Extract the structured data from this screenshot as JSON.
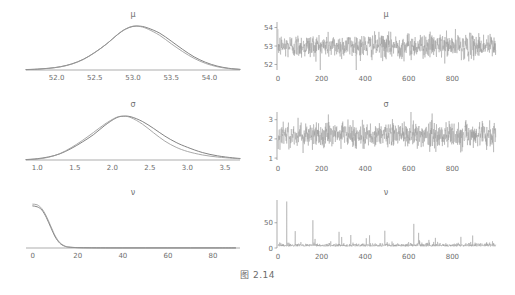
{
  "caption": "图 2.14",
  "figure": {
    "layout": "2 columns x 3 rows",
    "left_column": "posterior density",
    "right_column": "trace plot"
  },
  "panels": {
    "density_mu": {
      "title": "μ",
      "xticks": [
        "52.0",
        "52.5",
        "53.0",
        "53.5",
        "54.0"
      ]
    },
    "density_sigma": {
      "title": "σ",
      "xticks": [
        "1.0",
        "1.5",
        "2.0",
        "2.5",
        "3.0",
        "3.5"
      ]
    },
    "density_nu": {
      "title": "ν",
      "xticks": [
        "0",
        "20",
        "40",
        "60",
        "80"
      ]
    },
    "trace_mu": {
      "title": "μ",
      "yticks": [
        "52",
        "53",
        "54"
      ],
      "xticks": [
        "0",
        "200",
        "400",
        "600",
        "800"
      ]
    },
    "trace_sigma": {
      "title": "σ",
      "yticks": [
        "1",
        "2",
        "3"
      ],
      "xticks": [
        "0",
        "200",
        "400",
        "600",
        "800"
      ]
    },
    "trace_nu": {
      "title": "ν",
      "yticks": [
        "0",
        "50"
      ],
      "xticks": [
        "0",
        "200",
        "400",
        "600",
        "800"
      ]
    }
  },
  "chart_data": [
    {
      "type": "line",
      "name": "density_mu",
      "title": "μ",
      "xlabel": "",
      "ylabel": "",
      "xlim": [
        51.6,
        54.4
      ],
      "ylim": [
        0,
        1.05
      ],
      "grid": false,
      "legend": false,
      "series": [
        {
          "name": "kernel density",
          "color": "#6d6d6d",
          "x": [
            51.6,
            51.75,
            51.9,
            52.05,
            52.2,
            52.35,
            52.5,
            52.65,
            52.8,
            52.9,
            53.0,
            53.1,
            53.2,
            53.35,
            53.5,
            53.65,
            53.8,
            53.95,
            54.1,
            54.25,
            54.4
          ],
          "y": [
            0.01,
            0.02,
            0.04,
            0.075,
            0.14,
            0.245,
            0.4,
            0.59,
            0.81,
            0.93,
            0.995,
            1.0,
            0.955,
            0.84,
            0.66,
            0.47,
            0.3,
            0.175,
            0.09,
            0.04,
            0.015
          ]
        },
        {
          "name": "normal approximation",
          "color": "#9a9a9a",
          "x": [
            51.6,
            51.75,
            51.9,
            52.05,
            52.2,
            52.35,
            52.5,
            52.65,
            52.8,
            52.9,
            53.0,
            53.1,
            53.2,
            53.35,
            53.5,
            53.65,
            53.8,
            53.95,
            54.1,
            54.25,
            54.4
          ],
          "y": [
            0.008,
            0.018,
            0.038,
            0.072,
            0.135,
            0.24,
            0.398,
            0.588,
            0.815,
            0.935,
            1.0,
            0.99,
            0.93,
            0.79,
            0.6,
            0.42,
            0.265,
            0.15,
            0.075,
            0.033,
            0.012
          ]
        }
      ]
    },
    {
      "type": "line",
      "name": "density_sigma",
      "title": "σ",
      "xlabel": "",
      "ylabel": "",
      "xlim": [
        0.85,
        3.7
      ],
      "ylim": [
        0,
        1.05
      ],
      "grid": false,
      "legend": false,
      "series": [
        {
          "name": "kernel density",
          "color": "#6d6d6d",
          "x": [
            0.85,
            1.0,
            1.15,
            1.3,
            1.45,
            1.6,
            1.75,
            1.9,
            2.05,
            2.15,
            2.25,
            2.4,
            2.55,
            2.7,
            2.85,
            3.0,
            3.2,
            3.4,
            3.6,
            3.7
          ],
          "y": [
            0.01,
            0.03,
            0.07,
            0.14,
            0.26,
            0.41,
            0.58,
            0.79,
            0.96,
            1.0,
            0.985,
            0.88,
            0.72,
            0.545,
            0.4,
            0.29,
            0.17,
            0.095,
            0.05,
            0.035
          ]
        },
        {
          "name": "normal approximation",
          "color": "#9a9a9a",
          "x": [
            0.85,
            1.0,
            1.15,
            1.3,
            1.45,
            1.6,
            1.75,
            1.9,
            2.05,
            2.15,
            2.25,
            2.4,
            2.55,
            2.7,
            2.85,
            3.0,
            3.2,
            3.4,
            3.6,
            3.7
          ],
          "y": [
            0.006,
            0.022,
            0.062,
            0.145,
            0.28,
            0.445,
            0.63,
            0.82,
            0.97,
            1.0,
            0.965,
            0.82,
            0.62,
            0.43,
            0.29,
            0.195,
            0.115,
            0.068,
            0.04,
            0.03
          ]
        }
      ]
    },
    {
      "type": "line",
      "name": "density_nu",
      "title": "ν",
      "xlabel": "",
      "ylabel": "",
      "xlim": [
        -3,
        92
      ],
      "ylim": [
        0,
        1.05
      ],
      "grid": false,
      "legend": false,
      "series": [
        {
          "name": "kernel density",
          "color": "#6d6d6d",
          "x": [
            0,
            2,
            4,
            6,
            8,
            10,
            12,
            14,
            16,
            20,
            25,
            30,
            40,
            50,
            60,
            70,
            80,
            90
          ],
          "y": [
            0.96,
            0.94,
            0.87,
            0.7,
            0.47,
            0.25,
            0.11,
            0.045,
            0.02,
            0.008,
            0.004,
            0.003,
            0.002,
            0.002,
            0.002,
            0.002,
            0.002,
            0.002
          ]
        },
        {
          "name": "normal approximation",
          "color": "#9a9a9a",
          "x": [
            0,
            2,
            4,
            6,
            8,
            10,
            12,
            14,
            16,
            20,
            25,
            30,
            40,
            50,
            60,
            70,
            80,
            90
          ],
          "y": [
            1.0,
            0.985,
            0.9,
            0.73,
            0.5,
            0.275,
            0.125,
            0.052,
            0.022,
            0.009,
            0.005,
            0.003,
            0.002,
            0.002,
            0.002,
            0.002,
            0.002,
            0.002
          ]
        }
      ]
    },
    {
      "type": "line",
      "name": "trace_mu",
      "title": "μ",
      "xlabel": "iteration",
      "ylabel": "",
      "xlim": [
        0,
        1000
      ],
      "ylim": [
        51.7,
        54.3
      ],
      "yticks": [
        52,
        53,
        54
      ],
      "xticks": [
        0,
        200,
        400,
        600,
        800
      ],
      "grid": false,
      "legend": false,
      "series": [
        {
          "name": "mu chain",
          "color": "#9b9b9b",
          "mean": 53.0,
          "sd": 0.33,
          "n": 1000
        }
      ]
    },
    {
      "type": "line",
      "name": "trace_sigma",
      "title": "σ",
      "xlabel": "iteration",
      "ylabel": "",
      "xlim": [
        0,
        1000
      ],
      "ylim": [
        0.9,
        3.4
      ],
      "yticks": [
        1,
        2,
        3
      ],
      "xticks": [
        0,
        200,
        400,
        600,
        800
      ],
      "grid": false,
      "legend": false,
      "series": [
        {
          "name": "sigma chain",
          "color": "#9b9b9b",
          "mean": 2.2,
          "sd": 0.33,
          "n": 1000
        }
      ]
    },
    {
      "type": "line",
      "name": "trace_nu",
      "title": "ν",
      "xlabel": "iteration",
      "ylabel": "",
      "xlim": [
        0,
        1000
      ],
      "ylim": [
        0,
        95
      ],
      "yticks": [
        0,
        50
      ],
      "xticks": [
        0,
        200,
        400,
        600,
        800
      ],
      "grid": false,
      "legend": false,
      "series": [
        {
          "name": "nu chain",
          "color": "#9b9b9b",
          "median": 6,
          "spikes_at": [
            40,
            160,
            280,
            645
          ],
          "max": 92,
          "n": 1000
        }
      ]
    }
  ]
}
